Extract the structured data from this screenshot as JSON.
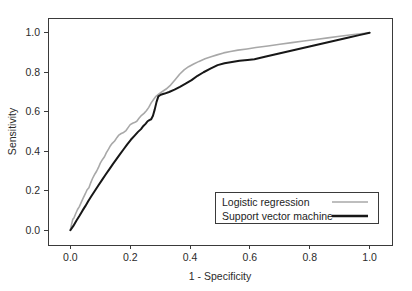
{
  "chart_data": {
    "type": "line",
    "title": "",
    "xlabel": "1 - Specificity",
    "ylabel": "Sensitivity",
    "xlim": [
      0.0,
      1.0
    ],
    "ylim": [
      0.0,
      1.0
    ],
    "xticks": [
      "0.0",
      "0.2",
      "0.4",
      "0.6",
      "0.8",
      "1.0"
    ],
    "xtick_values": [
      0.0,
      0.2,
      0.4,
      0.6,
      0.8,
      1.0
    ],
    "yticks": [
      "0.0",
      "0.2",
      "0.4",
      "0.6",
      "0.8",
      "1.0"
    ],
    "ytick_values": [
      0.0,
      0.2,
      0.4,
      0.6,
      0.8,
      1.0
    ],
    "grid": false,
    "legend_position": "bottom-right",
    "series": [
      {
        "name": "Logistic regression",
        "color": "#a8a8a8",
        "width": 1.6,
        "points": [
          [
            0.0,
            0.0
          ],
          [
            0.004,
            0.03
          ],
          [
            0.008,
            0.055
          ],
          [
            0.012,
            0.062
          ],
          [
            0.018,
            0.085
          ],
          [
            0.024,
            0.105
          ],
          [
            0.03,
            0.12
          ],
          [
            0.036,
            0.14
          ],
          [
            0.042,
            0.16
          ],
          [
            0.05,
            0.185
          ],
          [
            0.056,
            0.205
          ],
          [
            0.062,
            0.215
          ],
          [
            0.068,
            0.24
          ],
          [
            0.074,
            0.262
          ],
          [
            0.082,
            0.285
          ],
          [
            0.088,
            0.3
          ],
          [
            0.094,
            0.318
          ],
          [
            0.1,
            0.34
          ],
          [
            0.108,
            0.36
          ],
          [
            0.114,
            0.372
          ],
          [
            0.12,
            0.392
          ],
          [
            0.128,
            0.412
          ],
          [
            0.134,
            0.428
          ],
          [
            0.14,
            0.44
          ],
          [
            0.148,
            0.452
          ],
          [
            0.156,
            0.47
          ],
          [
            0.162,
            0.482
          ],
          [
            0.17,
            0.49
          ],
          [
            0.178,
            0.495
          ],
          [
            0.186,
            0.505
          ],
          [
            0.194,
            0.522
          ],
          [
            0.2,
            0.535
          ],
          [
            0.208,
            0.542
          ],
          [
            0.214,
            0.545
          ],
          [
            0.222,
            0.552
          ],
          [
            0.23,
            0.568
          ],
          [
            0.238,
            0.582
          ],
          [
            0.246,
            0.592
          ],
          [
            0.254,
            0.605
          ],
          [
            0.262,
            0.622
          ],
          [
            0.27,
            0.645
          ],
          [
            0.278,
            0.662
          ],
          [
            0.286,
            0.678
          ],
          [
            0.294,
            0.688
          ],
          [
            0.305,
            0.7
          ],
          [
            0.32,
            0.715
          ],
          [
            0.335,
            0.735
          ],
          [
            0.35,
            0.762
          ],
          [
            0.365,
            0.79
          ],
          [
            0.38,
            0.812
          ],
          [
            0.395,
            0.828
          ],
          [
            0.412,
            0.842
          ],
          [
            0.43,
            0.855
          ],
          [
            0.45,
            0.868
          ],
          [
            0.47,
            0.878
          ],
          [
            0.49,
            0.888
          ],
          [
            0.512,
            0.898
          ],
          [
            0.535,
            0.905
          ],
          [
            0.56,
            0.912
          ],
          [
            0.59,
            0.918
          ],
          [
            0.62,
            0.925
          ],
          [
            0.66,
            0.933
          ],
          [
            0.7,
            0.942
          ],
          [
            0.74,
            0.95
          ],
          [
            0.78,
            0.958
          ],
          [
            0.82,
            0.966
          ],
          [
            0.86,
            0.974
          ],
          [
            0.9,
            0.982
          ],
          [
            0.94,
            0.99
          ],
          [
            0.97,
            0.995
          ],
          [
            1.0,
            1.0
          ]
        ]
      },
      {
        "name": "Support vector machine",
        "color": "#171717",
        "width": 2.0,
        "points": [
          [
            0.0,
            0.0
          ],
          [
            0.01,
            0.022
          ],
          [
            0.02,
            0.048
          ],
          [
            0.03,
            0.072
          ],
          [
            0.04,
            0.098
          ],
          [
            0.05,
            0.122
          ],
          [
            0.06,
            0.148
          ],
          [
            0.07,
            0.172
          ],
          [
            0.082,
            0.2
          ],
          [
            0.094,
            0.228
          ],
          [
            0.106,
            0.255
          ],
          [
            0.118,
            0.282
          ],
          [
            0.13,
            0.308
          ],
          [
            0.142,
            0.335
          ],
          [
            0.154,
            0.36
          ],
          [
            0.166,
            0.385
          ],
          [
            0.178,
            0.41
          ],
          [
            0.19,
            0.435
          ],
          [
            0.202,
            0.458
          ],
          [
            0.214,
            0.478
          ],
          [
            0.226,
            0.498
          ],
          [
            0.236,
            0.512
          ],
          [
            0.244,
            0.528
          ],
          [
            0.252,
            0.54
          ],
          [
            0.258,
            0.552
          ],
          [
            0.264,
            0.558
          ],
          [
            0.27,
            0.562
          ],
          [
            0.276,
            0.58
          ],
          [
            0.282,
            0.612
          ],
          [
            0.288,
            0.65
          ],
          [
            0.294,
            0.678
          ],
          [
            0.302,
            0.686
          ],
          [
            0.315,
            0.692
          ],
          [
            0.33,
            0.7
          ],
          [
            0.348,
            0.712
          ],
          [
            0.366,
            0.726
          ],
          [
            0.385,
            0.742
          ],
          [
            0.405,
            0.76
          ],
          [
            0.425,
            0.782
          ],
          [
            0.445,
            0.8
          ],
          [
            0.468,
            0.818
          ],
          [
            0.492,
            0.836
          ],
          [
            0.515,
            0.846
          ],
          [
            0.54,
            0.852
          ],
          [
            0.565,
            0.858
          ],
          [
            0.592,
            0.862
          ],
          [
            0.615,
            0.866
          ],
          [
            0.65,
            0.878
          ],
          [
            0.69,
            0.892
          ],
          [
            0.73,
            0.906
          ],
          [
            0.77,
            0.92
          ],
          [
            0.81,
            0.934
          ],
          [
            0.85,
            0.948
          ],
          [
            0.89,
            0.962
          ],
          [
            0.93,
            0.976
          ],
          [
            0.965,
            0.988
          ],
          [
            1.0,
            1.0
          ]
        ]
      }
    ],
    "legend_entries": [
      {
        "label": "Logistic regression",
        "color": "#a8a8a8",
        "width": 1.6
      },
      {
        "label": "Support vector machine",
        "color": "#171717",
        "width": 2.4
      }
    ]
  }
}
